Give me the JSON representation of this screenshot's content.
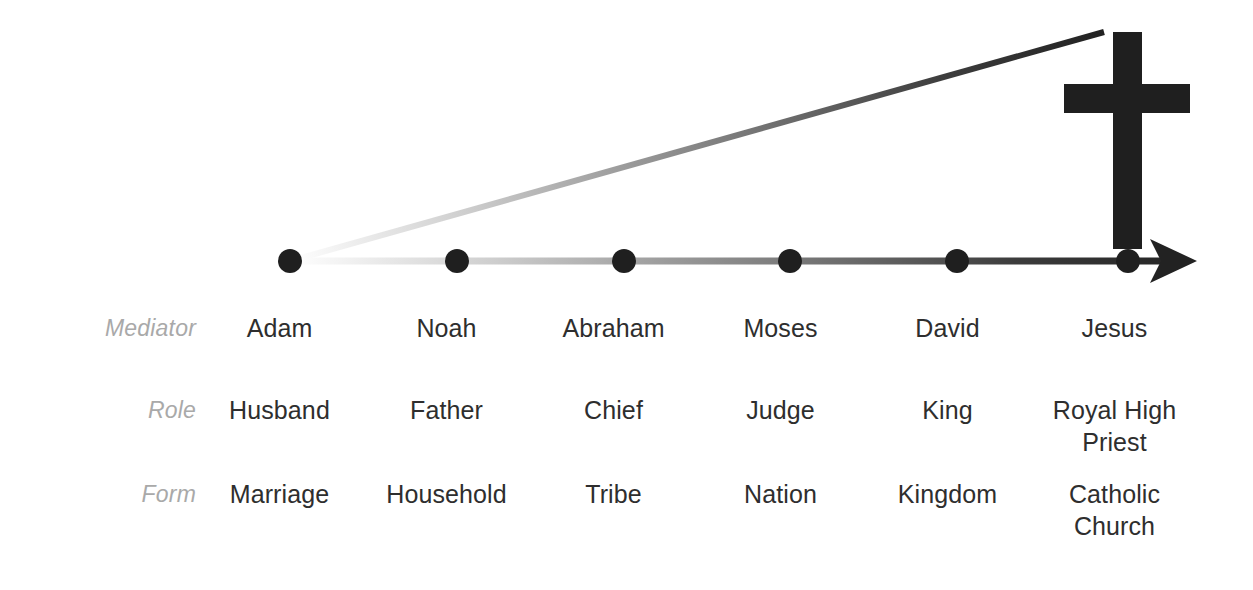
{
  "diagram": {
    "title_visible": false,
    "type": "covenant-timeline",
    "colors": {
      "ink": "#2e2e2e",
      "axis_dark": "#262626",
      "axis_light": "#ffffff",
      "row_label": "#a9a9a9",
      "background": "#ffffff"
    },
    "icons": {
      "cross": "cross-icon",
      "arrow": "arrow-right-icon",
      "node": "timeline-node-dot"
    },
    "axis": {
      "node_count": 6,
      "has_arrowhead": true,
      "gradient": "light-to-dark left-to-right"
    },
    "ascending_line": {
      "from_node_index": 0,
      "to": "cross-icon",
      "gradient": "light-to-dark left-to-right"
    }
  },
  "rows": [
    {
      "label": "Mediator",
      "cells": [
        {
          "line1": "Adam",
          "line2": ""
        },
        {
          "line1": "Noah",
          "line2": ""
        },
        {
          "line1": "Abraham",
          "line2": ""
        },
        {
          "line1": "Moses",
          "line2": ""
        },
        {
          "line1": "David",
          "line2": ""
        },
        {
          "line1": "Jesus",
          "line2": ""
        }
      ]
    },
    {
      "label": "Role",
      "cells": [
        {
          "line1": "Husband",
          "line2": ""
        },
        {
          "line1": "Father",
          "line2": ""
        },
        {
          "line1": "Chief",
          "line2": ""
        },
        {
          "line1": "Judge",
          "line2": ""
        },
        {
          "line1": "King",
          "line2": ""
        },
        {
          "line1": "Royal High",
          "line2": "Priest"
        }
      ]
    },
    {
      "label": "Form",
      "cells": [
        {
          "line1": "Marriage",
          "line2": ""
        },
        {
          "line1": "Household",
          "line2": ""
        },
        {
          "line1": "Tribe",
          "line2": ""
        },
        {
          "line1": "Nation",
          "line2": ""
        },
        {
          "line1": "Kingdom",
          "line2": ""
        },
        {
          "line1": "Catholic",
          "line2": "Church"
        }
      ]
    }
  ]
}
